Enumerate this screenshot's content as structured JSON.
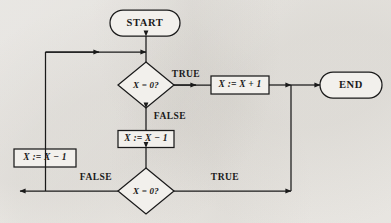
{
  "diagram": {
    "type": "flowchart",
    "title": "",
    "background_color": "#f2f0ec",
    "stroke_color": "#1a1a1a",
    "fill_color": "#f2f0ec",
    "nodes": [
      {
        "id": "start",
        "kind": "terminator",
        "label": "START",
        "cx": 145,
        "cy": 23,
        "w": 70,
        "h": 26
      },
      {
        "id": "cond1",
        "kind": "decision",
        "label": "X = 0?",
        "cx": 146,
        "cy": 85,
        "w": 56,
        "h": 46
      },
      {
        "id": "inc",
        "kind": "process",
        "label": "X := X + 1",
        "cx": 240,
        "cy": 85,
        "w": 58,
        "h": 18
      },
      {
        "id": "end",
        "kind": "terminator",
        "label": "END",
        "cx": 351,
        "cy": 85,
        "w": 62,
        "h": 26
      },
      {
        "id": "dec_mid",
        "kind": "process",
        "label": "X := X − 1",
        "cx": 146,
        "cy": 139,
        "w": 56,
        "h": 17
      },
      {
        "id": "dec_left",
        "kind": "process",
        "label": "X := X − 1",
        "cx": 45,
        "cy": 158,
        "w": 62,
        "h": 18
      },
      {
        "id": "cond2",
        "kind": "decision",
        "label": "X = 0?",
        "cx": 146,
        "cy": 191,
        "w": 56,
        "h": 46
      }
    ],
    "edge_labels": [
      {
        "id": "cond1-true",
        "text": "TRUE",
        "x": 186,
        "y": 75
      },
      {
        "id": "cond1-false",
        "text": "FALSE",
        "x": 170,
        "y": 117
      },
      {
        "id": "cond2-false",
        "text": "FALSE",
        "x": 96,
        "y": 178
      },
      {
        "id": "cond2-true",
        "text": "TRUE",
        "x": 225,
        "y": 178
      }
    ]
  }
}
